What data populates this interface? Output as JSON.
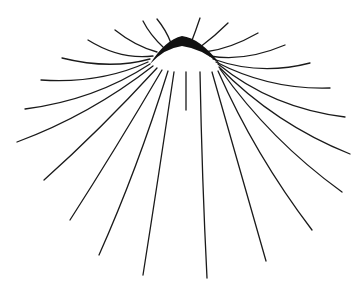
{
  "figure": {
    "title": "",
    "colors": {
      "background": "#ffffff",
      "stroke": "#1a1a1a",
      "dome": "#111111"
    },
    "apex": [
      182,
      38
    ],
    "rays": [
      {
        "d": "M171,43 Q166,30 157,19"
      },
      {
        "d": "M191,43 Q196,30 200,18"
      },
      {
        "d": "M164,48 Q150,35 143,21"
      },
      {
        "d": "M199,48 Q215,36 228,23"
      },
      {
        "d": "M157,52 Q135,46 115,30"
      },
      {
        "d": "M205,52 Q230,49 258,33"
      },
      {
        "d": "M153,56 Q120,60 88,40"
      },
      {
        "d": "M210,56 Q245,62 285,45"
      },
      {
        "d": "M150,59 Q110,70 62,58"
      },
      {
        "d": "M213,59 Q260,76 310,63"
      },
      {
        "d": "M148,62 Q100,84 41,80"
      },
      {
        "d": "M216,62 Q270,90 330,88"
      },
      {
        "d": "M150,64 Q95,100 25,109"
      },
      {
        "d": "M218,64 Q272,108 345,117"
      },
      {
        "d": "M153,66 Q90,115 17,142"
      },
      {
        "d": "M219,67 Q275,124 350,154"
      },
      {
        "d": "M157,68 Q100,130 44,180"
      },
      {
        "d": "M220,69 Q270,140 342,192"
      },
      {
        "d": "M162,70 Q115,150 70,220"
      },
      {
        "d": "M218,71 Q255,155 312,230"
      },
      {
        "d": "M168,71 Q137,170 99,255"
      },
      {
        "d": "M212,72 Q240,170 266,261"
      },
      {
        "d": "M174,72 Q158,180 143,275"
      },
      {
        "d": "M200,72 Q202,180 207,278"
      },
      {
        "d": "M186,72 Q186,100 186,110"
      }
    ],
    "dome_path": "M150,64 Q165,40 182,36 Q200,38 220,64 Q200,48 182,46 Q165,48 150,64 Z"
  }
}
